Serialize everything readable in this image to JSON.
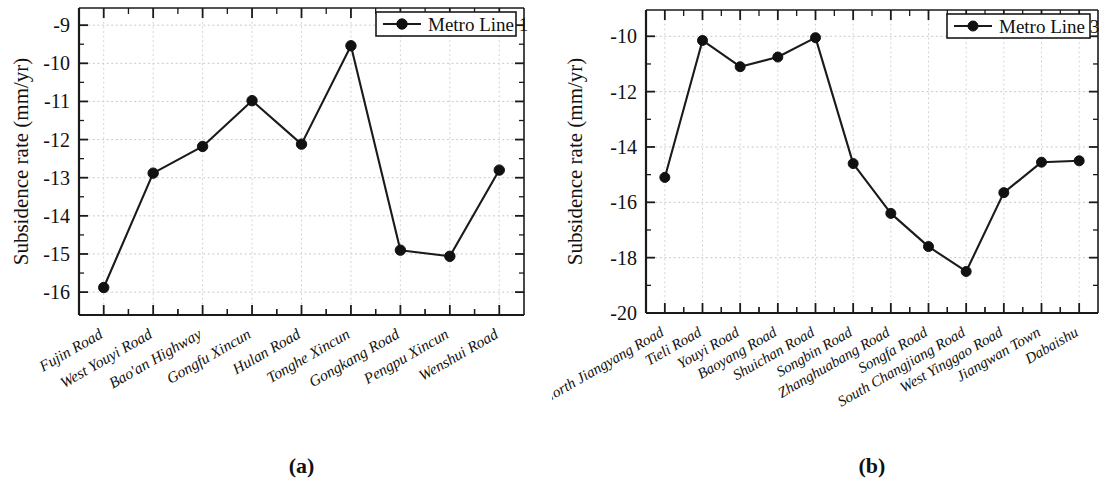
{
  "figure": {
    "background_color": "#ffffff",
    "line_color": "#111111",
    "grid_color": "#c9c9c9",
    "panels": [
      {
        "caption": "(a)",
        "ylabel": "Subsidence rate (mm/yr)",
        "legend_label": "Metro Line 1"
      },
      {
        "caption": "(b)",
        "ylabel": "Subsidence rate (mm/yr)",
        "legend_label": "Metro Line 3"
      }
    ]
  },
  "chart_data": [
    {
      "type": "line",
      "title": "(a)",
      "xlabel": "",
      "ylabel": "Subsidence rate (mm/yr)",
      "ylim": [
        -16.6,
        -8.55
      ],
      "yticks": [
        -9,
        -10,
        -11,
        -12,
        -13,
        -14,
        -15,
        -16
      ],
      "ytick_labels": [
        "-9",
        "-10",
        "-11",
        "-12",
        "-13",
        "-14",
        "-15",
        "-16"
      ],
      "grid": true,
      "legend_position": "top-right",
      "categories": [
        "Fujin Road",
        "West Youyi Road",
        "Bao'an Highway",
        "Gongfu Xincun",
        "Hulan Road",
        "Tonghe Xincun",
        "Gongkang Road",
        "Pengpu Xincun",
        "Wenshui Road"
      ],
      "series": [
        {
          "name": "Metro Line 1",
          "values": [
            -15.88,
            -12.88,
            -12.18,
            -10.98,
            -12.12,
            -9.54,
            -14.9,
            -15.06,
            -12.8
          ]
        }
      ]
    },
    {
      "type": "line",
      "title": "(b)",
      "xlabel": "",
      "ylabel": "Subsidence rate (mm/yr)",
      "ylim": [
        -20.0,
        -9.05
      ],
      "yticks": [
        -10,
        -12,
        -14,
        -16,
        -18,
        -20
      ],
      "ytick_labels": [
        "-10",
        "-12",
        "-14",
        "-16",
        "-18",
        "-20"
      ],
      "grid": true,
      "legend_position": "top-right",
      "categories": [
        "North Jiangyang Road",
        "Tieli Road",
        "Youyi Road",
        "Baoyang Road",
        "Shuichan Road",
        "Songbin Road",
        "Zhanghuabang Road",
        "Songfa Road",
        "South Changjiang Road",
        "West Yinggao Road",
        "Jiangwan Town",
        "Dabaishu"
      ],
      "series": [
        {
          "name": "Metro Line 3",
          "values": [
            -15.1,
            -10.15,
            -11.1,
            -10.75,
            -10.05,
            -14.6,
            -16.4,
            -17.6,
            -18.5,
            -15.65,
            -14.55,
            -14.5
          ]
        }
      ]
    }
  ]
}
